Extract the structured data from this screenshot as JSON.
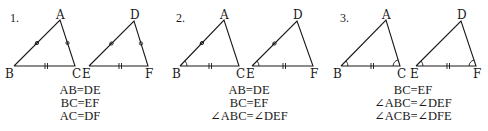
{
  "panels": [
    {
      "number": "1.",
      "triangles": [
        {
          "vertices": {
            "top": "A",
            "left": "B",
            "right": "C"
          }
        },
        {
          "vertices": {
            "top": "D",
            "left": "E",
            "right": "F"
          }
        }
      ],
      "marks": {
        "left_side": "single-circle-tick",
        "right_side": "circle-tick",
        "base": "double-tick"
      },
      "conditions": [
        "AB=DE",
        "BC=EF",
        "AC=DF"
      ]
    },
    {
      "number": "2.",
      "triangles": [
        {
          "vertices": {
            "top": "A",
            "left": "B",
            "right": "C"
          }
        },
        {
          "vertices": {
            "top": "D",
            "left": "E",
            "right": "F"
          }
        }
      ],
      "marks": {
        "left_side": "circle-tick",
        "base": "double-tick",
        "left_angle": "arc"
      },
      "conditions": [
        "AB=DE",
        "BC=EF",
        "∠ABC=∠DEF"
      ]
    },
    {
      "number": "3.",
      "triangles": [
        {
          "vertices": {
            "top": "A",
            "left": "B",
            "right": "C"
          }
        },
        {
          "vertices": {
            "top": "D",
            "left": "E",
            "right": "F"
          }
        }
      ],
      "marks": {
        "base": "double-tick",
        "left_angle": "arc",
        "right_angle": "arc"
      },
      "conditions": [
        "BC=EF",
        "∠ABC=∠DEF",
        "∠ACB=∠DFE"
      ]
    }
  ]
}
